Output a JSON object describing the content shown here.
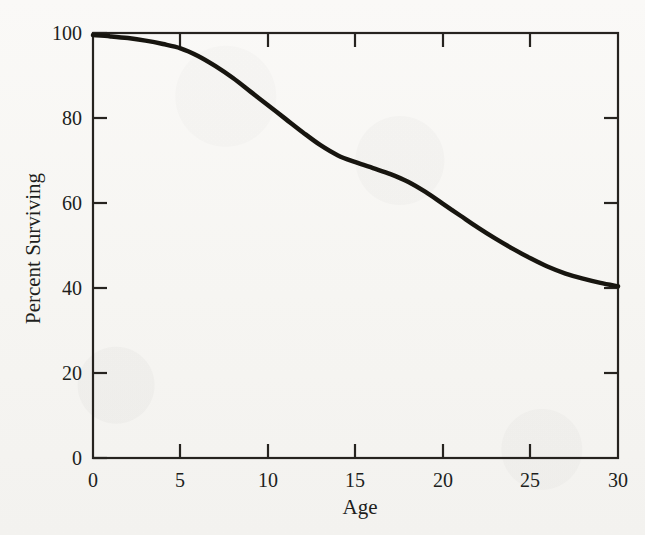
{
  "figure": {
    "background_color": "#f8f7f5",
    "ink_color": "#201e1c",
    "curve_color": "#17150f"
  },
  "chart_data": {
    "type": "line",
    "title": "",
    "subtitle": "",
    "xlabel": "Age",
    "ylabel": "Percent Surviving",
    "xlim": [
      0,
      30
    ],
    "ylim": [
      0,
      100
    ],
    "xticks": [
      0,
      5,
      10,
      15,
      20,
      25,
      30
    ],
    "xtick_labels": [
      "0",
      "5",
      "10",
      "15",
      "20",
      "25",
      "30"
    ],
    "yticks": [
      0,
      20,
      40,
      60,
      80,
      100
    ],
    "ytick_labels": [
      "0",
      "20",
      "40",
      "60",
      "80",
      "100"
    ],
    "grid": false,
    "legend": false,
    "legend_position": "none",
    "tick_direction": "in",
    "spines": [
      "left",
      "right",
      "top",
      "bottom"
    ],
    "series": [
      {
        "name": "Percent Surviving",
        "color": "#17150f",
        "line_width": 4.5,
        "x": [
          0,
          1,
          2,
          3,
          4,
          5,
          6,
          7,
          8,
          9,
          10,
          11,
          12,
          13,
          14,
          15,
          16,
          17,
          18,
          19,
          20,
          21,
          22,
          23,
          24,
          25,
          26,
          27,
          28,
          29,
          30
        ],
        "y": [
          99.5,
          99.2,
          98.8,
          98.2,
          97.4,
          96.4,
          94.6,
          92.2,
          89.4,
          86.2,
          83.0,
          79.8,
          76.6,
          73.6,
          71.2,
          69.6,
          68.2,
          66.8,
          65.0,
          62.6,
          59.8,
          57.0,
          54.2,
          51.6,
          49.2,
          47.0,
          45.0,
          43.4,
          42.2,
          41.2,
          40.4
        ]
      }
    ],
    "annotations": []
  },
  "axes_labels": {
    "x_title": "Age",
    "y_title": "Percent Surviving"
  }
}
